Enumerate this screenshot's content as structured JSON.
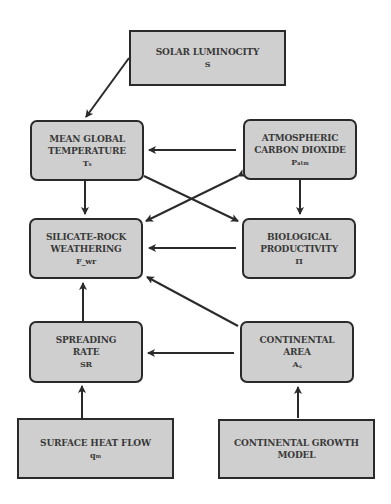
{
  "nodes": {
    "solar": {
      "lines": [
        "SOLAR LUMINOCITY"
      ],
      "symbol": "S"
    },
    "temperature": {
      "lines": [
        "MEAN GLOBAL",
        "TEMPERATURE"
      ],
      "symbol": "Tₛ"
    },
    "co2": {
      "lines": [
        "ATMOSPHERIC",
        "CARBON DIOXIDE"
      ],
      "symbol": "Pₐₜₘ"
    },
    "weathering": {
      "lines": [
        "SILICATE-ROCK",
        "WEATHERING"
      ],
      "symbol": "F_wr"
    },
    "productivity": {
      "lines": [
        "BIOLOGICAL",
        "PRODUCTIVITY"
      ],
      "symbol": "Π"
    },
    "spreading": {
      "lines": [
        "SPREADING",
        "RATE"
      ],
      "symbol": "SR"
    },
    "area": {
      "lines": [
        "CONTINENTAL",
        "AREA"
      ],
      "symbol": "A꜀"
    },
    "heatflow": {
      "lines": [
        "SURFACE HEAT FLOW"
      ],
      "symbol": "qₘ"
    },
    "growth": {
      "lines": [
        "CONTINENTAL GROWTH",
        "MODEL"
      ],
      "symbol": ""
    }
  },
  "edges": [
    {
      "from": "solar",
      "to": "temperature"
    },
    {
      "from": "co2",
      "to": "temperature"
    },
    {
      "from": "temperature",
      "to": "weathering"
    },
    {
      "from": "temperature",
      "to": "productivity"
    },
    {
      "from": "co2",
      "to": "weathering",
      "bidirectional": true
    },
    {
      "from": "co2",
      "to": "productivity"
    },
    {
      "from": "productivity",
      "to": "weathering"
    },
    {
      "from": "spreading",
      "to": "weathering"
    },
    {
      "from": "area",
      "to": "weathering"
    },
    {
      "from": "area",
      "to": "spreading"
    },
    {
      "from": "heatflow",
      "to": "spreading"
    },
    {
      "from": "growth",
      "to": "area"
    }
  ],
  "colors": {
    "box_fill": "#cfcfcf",
    "border": "#2a2a2a",
    "text": "#3a3a3a"
  }
}
